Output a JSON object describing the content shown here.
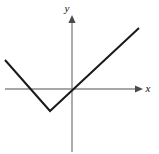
{
  "figure": {
    "name": "coordinate-plane-graph",
    "width": 159,
    "height": 154,
    "background_color": "#ffffff"
  },
  "axes": {
    "x_label": "x",
    "y_label": "y",
    "axis_color": "#8a8a8a",
    "arrow_color": "#4a4a4a",
    "origin_px": [
      72,
      89
    ],
    "x_axis_px": {
      "x1": 5,
      "y1": 89,
      "x2": 143,
      "y2": 89
    },
    "y_axis_px": {
      "x1": 72,
      "y1": 15,
      "x2": 72,
      "y2": 152
    },
    "x_arrow": "right",
    "y_arrow": "up",
    "x_label_pos_px": [
      148,
      92
    ],
    "y_label_pos_px": [
      67,
      12
    ]
  },
  "chart_data": {
    "type": "line",
    "title": "",
    "subtitle": "",
    "xlabel": "x",
    "ylabel": "y",
    "grid": false,
    "legend": null,
    "line_color": "#1a1a1a",
    "line_width": 2,
    "axis_ranges": {
      "xlim": [
        -3.5,
        2.0
      ],
      "ylim": [
        -1.2,
        1.8
      ]
    },
    "points_px": [
      [
        5,
        60
      ],
      [
        50,
        111
      ],
      [
        139,
        28
      ]
    ],
    "x": [
      -3.35,
      -1.1,
      3.35
    ],
    "y": [
      0.64,
      -0.55,
      1.52
    ],
    "series": [
      {
        "name": "f(x)",
        "x": [
          -3.35,
          -1.1,
          3.35
        ],
        "values": [
          0.64,
          -0.55,
          1.52
        ]
      }
    ],
    "vertex": {
      "x": -1.1,
      "y": -0.55,
      "px": [
        50,
        111
      ]
    },
    "x_intercepts": [
      -2.1,
      0.0
    ],
    "y_intercept": 0.0,
    "annotations": []
  }
}
